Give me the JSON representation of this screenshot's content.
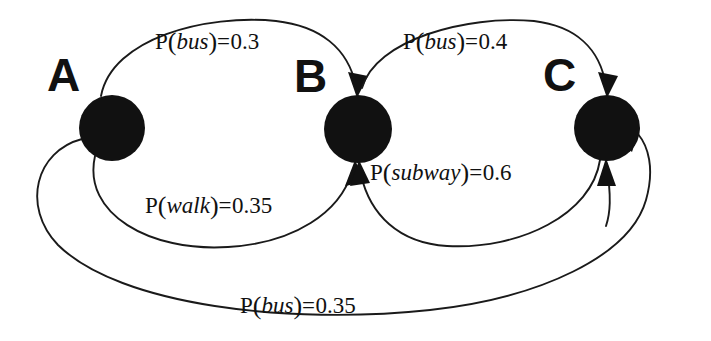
{
  "diagram": {
    "type": "state-transition-diagram",
    "background_color": "#ffffff",
    "ink_color": "#111111",
    "nodes": [
      {
        "id": "A",
        "label": "A",
        "cx": 112,
        "cy": 128,
        "r": 33,
        "label_x": 47,
        "label_y": 52
      },
      {
        "id": "B",
        "label": "B",
        "cx": 358,
        "cy": 129,
        "r": 34,
        "label_x": 294,
        "label_y": 53
      },
      {
        "id": "C",
        "label": "C",
        "cx": 607,
        "cy": 128,
        "r": 33,
        "label_x": 543,
        "label_y": 52
      }
    ],
    "edges": [
      {
        "id": "a-to-b-bus",
        "from": "A",
        "to": "B",
        "event": "bus",
        "probability": "0.3",
        "label_text": "P(bus)=0.3",
        "label_x": 155,
        "label_y": 28
      },
      {
        "id": "b-to-c-bus",
        "from": "B",
        "to": "C",
        "event": "bus",
        "probability": "0.4",
        "label_text": "P(bus)=0.4",
        "label_x": 403,
        "label_y": 28
      },
      {
        "id": "a-to-b-walk",
        "from": "A",
        "to": "B",
        "event": "walk",
        "probability": "0.35",
        "label_text": "P(walk)=0.35",
        "label_x": 145,
        "label_y": 192
      },
      {
        "id": "c-to-b-subway",
        "from": "C",
        "to": "B",
        "event": "subway",
        "probability": "0.6",
        "label_text": "P(subway)=0.6",
        "label_x": 370,
        "label_y": 159
      },
      {
        "id": "a-to-c-bus",
        "from": "A",
        "to": "C",
        "event": "bus",
        "probability": "0.35",
        "label_text": "P(bus)=0.35",
        "label_x": 240,
        "label_y": 292
      }
    ]
  }
}
